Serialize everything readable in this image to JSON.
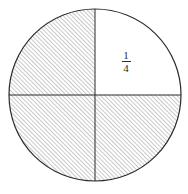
{
  "figure": {
    "kind": "fraction-circle-diagram",
    "background_color": "#ffffff",
    "outline_color": "#2b2b2b",
    "hatch_color": "#4a4a4a",
    "label_color": "#2b2b2b",
    "circle": {
      "center_x": 95,
      "center_y": 95,
      "radius": 86,
      "stroke_width": 1.2
    },
    "diameters": [
      {
        "name": "horizontal-diameter",
        "orientation": "horizontal",
        "position": 95
      },
      {
        "name": "vertical-diameter",
        "orientation": "vertical",
        "position": 95
      }
    ],
    "hatch": {
      "direction": "45-degree-forward-slash",
      "spacing_px": 3,
      "line_width": 0.6
    },
    "quadrants": [
      {
        "name": "upper-left",
        "shaded": true,
        "label": ""
      },
      {
        "name": "upper-right",
        "shaded": false,
        "label": "1/4"
      },
      {
        "name": "lower-left",
        "shaded": true,
        "label": ""
      },
      {
        "name": "lower-right",
        "shaded": true,
        "label": ""
      }
    ],
    "label": {
      "numerator": "1",
      "denominator": "4",
      "x": 126,
      "y": 50
    }
  }
}
